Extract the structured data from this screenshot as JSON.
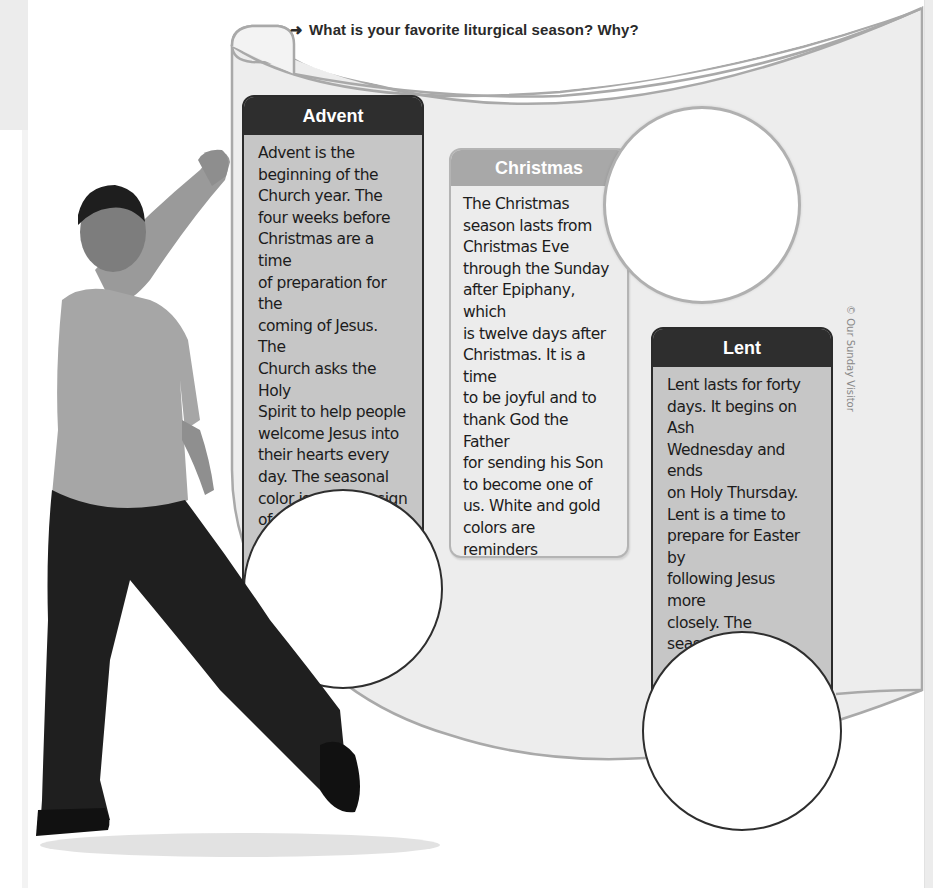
{
  "page": {
    "question": "What is your favorite liturgical season? Why?",
    "question_icon": "arrow-right-icon",
    "credit": "© Our Sunday Visitor"
  },
  "seasons": [
    {
      "title": "Advent",
      "style": "dark",
      "text": "Advent is the beginning of the Church year. The four weeks before Christmas are a time of preparation for the coming of Jesus. The Church asks the Holy Spirit to help people welcome Jesus into their hearts every day. The seasonal color is violet, a sign of waiting.",
      "lines": [
        "Advent is the",
        "beginning of the",
        "Church year. The",
        "four weeks before",
        "Christmas are a time",
        "of preparation for the",
        "coming of Jesus. The",
        "Church asks the Holy",
        "Spirit to help people",
        "welcome Jesus into",
        "their hearts every",
        "day. The seasonal",
        "color is violet, a sign",
        "of waiting."
      ]
    },
    {
      "title": "Christmas",
      "style": "light",
      "text": "The Christmas season lasts from Christmas Eve through the Sunday after Epiphany, which is twelve days after Christmas. It is a time to be joyful and to thank God the Father for sending his Son to become one of us. White and gold colors are reminders to celebrate the gift of Jesus.",
      "lines": [
        "The Christmas",
        "season lasts from",
        "Christmas Eve",
        "through the Sunday",
        "after Epiphany, which",
        "is twelve days after",
        "Christmas. It is a time",
        "to be joyful and to",
        "thank God the Father",
        "for sending his Son",
        "to become one of",
        "us. White and gold",
        "colors are reminders",
        "to celebrate the gift",
        "of Jesus."
      ]
    },
    {
      "title": "Lent",
      "style": "dark",
      "text": "Lent lasts for forty days. It begins on Ash Wednesday and ends on Holy Thursday. Lent is a time to prepare for Easter by following Jesus more closely. The seasonal color of violet is used as a sign of penance.",
      "lines": [
        "Lent lasts for forty",
        "days. It begins on Ash",
        "Wednesday and ends",
        "on Holy Thursday.",
        "Lent is a time to",
        "prepare for Easter by",
        "following Jesus more",
        "closely. The seasonal",
        "color of violet is used",
        "as a sign of penance."
      ]
    }
  ],
  "colors": {
    "dark_header": "#2e2e2e",
    "dark_body": "#c6c6c6",
    "light_header": "#a8a8a8",
    "light_body": "#ececec",
    "scroll_fill": "#ededed",
    "scroll_edge": "#a9a9a9"
  }
}
